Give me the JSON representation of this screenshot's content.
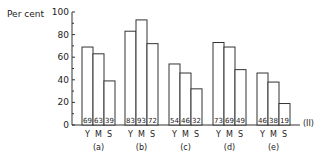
{
  "chart_data": {
    "type": "bar",
    "title": "",
    "ylabel": "Per cent",
    "xlabel": "",
    "ylim": [
      0,
      100
    ],
    "yticks": [
      0,
      20,
      40,
      60,
      80,
      100
    ],
    "grid": false,
    "legend": null,
    "annotation": "(II)",
    "bar_labels": [
      "Y",
      "M",
      "S"
    ],
    "categories": [
      "(a)",
      "(b)",
      "(c)",
      "(d)",
      "(e)"
    ],
    "groups": [
      {
        "name": "(a)",
        "values": [
          69,
          63,
          39
        ]
      },
      {
        "name": "(b)",
        "values": [
          83,
          93,
          72
        ]
      },
      {
        "name": "(c)",
        "values": [
          54,
          46,
          32
        ]
      },
      {
        "name": "(d)",
        "values": [
          73,
          69,
          49
        ]
      },
      {
        "name": "(e)",
        "values": [
          46,
          38,
          19
        ]
      }
    ],
    "series": [
      {
        "name": "Y",
        "values": [
          69,
          83,
          54,
          73,
          46
        ]
      },
      {
        "name": "M",
        "values": [
          63,
          93,
          46,
          69,
          38
        ]
      },
      {
        "name": "S",
        "values": [
          39,
          72,
          32,
          49,
          19
        ]
      }
    ]
  }
}
